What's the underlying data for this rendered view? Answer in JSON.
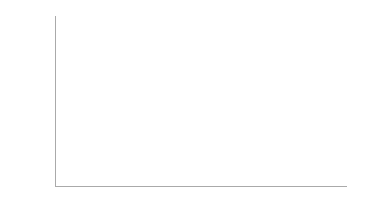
{
  "chart_data": {
    "type": "bar",
    "stacked": true,
    "title": "",
    "xlabel": "",
    "ylabel": "Percent",
    "ylim": [
      0,
      100
    ],
    "yticks": [
      "0%",
      "10%",
      "20%",
      "30%",
      "40%",
      "50%",
      "60%",
      "70%",
      "80%",
      "90%",
      "100%"
    ],
    "categories": [
      "Female",
      "Male"
    ],
    "series": [
      {
        "name": "Firearm",
        "color": "#5e5e5e",
        "values": [
          31.0,
          55.4
        ],
        "labels": [
          "31.0",
          "55.4"
        ]
      },
      {
        "name": "Poisoning",
        "color": "#262626",
        "values": [
          34.1,
          10.6
        ],
        "labels": [
          "34.1",
          "10.6"
        ]
      },
      {
        "name": "Suffocation",
        "color": "#b5b5b5",
        "values": [
          26.2,
          26.8
        ],
        "labels": [
          "26.2",
          "26.8"
        ]
      },
      {
        "name": "Other",
        "color": "#3a3a3a",
        "values": [
          8.6,
          7.2
        ],
        "labels": [
          "8.6",
          "7.2"
        ]
      }
    ],
    "legend": {
      "position": "right",
      "entries": [
        "Other",
        "Suffocation",
        "Poisoning",
        "Firearm"
      ]
    },
    "grid": false
  }
}
